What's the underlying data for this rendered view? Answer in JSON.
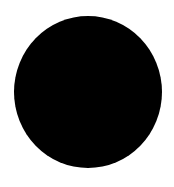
{
  "canvas": {
    "width": 174,
    "height": 187,
    "background_color": "#ffffff"
  },
  "shape": {
    "type": "circle",
    "fill_color": "#000000",
    "center": [
      88,
      92
    ],
    "radius": 74
  }
}
